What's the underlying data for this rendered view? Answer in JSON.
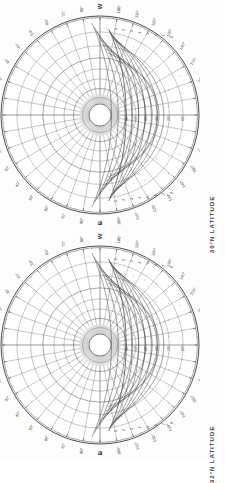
{
  "document": {
    "title": "Celestial Navigation Star Finder Charts",
    "background_color": "#fdfdfd",
    "ink_color": "#3a3a3d",
    "orientation_note": "charts printed rotated 90 degrees"
  },
  "charts": [
    {
      "id": "chart-top",
      "caption": "30°N LATITUDE",
      "latitude_value": 30,
      "latitude_hemisphere": "N",
      "cardinal_points": {
        "left": "N",
        "right": "S",
        "top": "W",
        "bottom": "E"
      },
      "azimuth_labels": [
        "10°",
        "20°",
        "30°",
        "40°",
        "50°",
        "60°",
        "70°",
        "80°",
        "100°",
        "110°",
        "120°",
        "130°",
        "140°",
        "150°",
        "160°",
        "170°"
      ],
      "altitude_labels": [
        "10°",
        "20°",
        "30°",
        "40°",
        "50°",
        "60°",
        "70°",
        "80°"
      ],
      "declination_labels": [
        "0°",
        "10°",
        "20°",
        "30°",
        "40°",
        "50°",
        "60°"
      ],
      "hour_angle_labels": [
        "1",
        "2",
        "3",
        "4",
        "5",
        "6",
        "7",
        "8"
      ],
      "rim_tick_interval_degrees": 5,
      "grid_interval_degrees": 10
    },
    {
      "id": "chart-bottom",
      "caption": "32°N LATITUDE",
      "latitude_value": 32,
      "latitude_hemisphere": "N",
      "cardinal_points": {
        "left": "N",
        "right": "S",
        "top": "W",
        "bottom": "E"
      },
      "azimuth_labels": [
        "10°",
        "20°",
        "30°",
        "40°",
        "50°",
        "60°",
        "70°",
        "80°",
        "100°",
        "110°",
        "120°",
        "130°",
        "140°",
        "150°",
        "160°",
        "170°"
      ],
      "altitude_labels": [
        "10°",
        "20°",
        "30°",
        "40°",
        "50°",
        "60°",
        "70°",
        "80°"
      ],
      "declination_labels": [
        "0°",
        "10°",
        "20°",
        "30°",
        "40°",
        "50°",
        "60°"
      ],
      "hour_angle_labels": [
        "1",
        "2",
        "3",
        "4",
        "5",
        "6",
        "7",
        "8"
      ],
      "rim_tick_interval_degrees": 5,
      "grid_interval_degrees": 10
    }
  ],
  "chart_data": {
    "type": "scatter",
    "subtitle": "Two circular projections, 30°N and 32°N latitude",
    "xlabel": "Azimuth",
    "ylabel": "Altitude",
    "grid": true,
    "legend_position": "none",
    "projection": "stereographic horizon (azimuth-altitude)",
    "panels": [
      {
        "name": "30°N LATITUDE",
        "cardinals": [
          "N",
          "E",
          "S",
          "W"
        ],
        "azimuth_ticks": [
          0,
          10,
          20,
          30,
          40,
          50,
          60,
          70,
          80,
          90,
          100,
          110,
          120,
          130,
          140,
          150,
          160,
          170,
          180
        ],
        "azimuth_tick_labels": [
          "N",
          "10°",
          "20°",
          "30°",
          "40°",
          "50°",
          "60°",
          "70°",
          "80°",
          "W",
          "100°",
          "110°",
          "120°",
          "130°",
          "140°",
          "150°",
          "160°",
          "170°",
          "S"
        ],
        "altitude_circles": [
          0,
          10,
          20,
          30,
          40,
          50,
          60,
          70,
          80,
          90
        ],
        "altitude_circle_labels": [
          "0°",
          "10°",
          "20°",
          "30°",
          "40°",
          "50°",
          "60°",
          "70°",
          "80°",
          "90°"
        ],
        "declination_curves": [
          0,
          10,
          20,
          30,
          40,
          50,
          60
        ],
        "hour_circles": [
          1,
          2,
          3,
          4,
          5,
          6,
          7,
          8
        ],
        "rim_ticks_every": 5,
        "radius_normalized": 1.0
      },
      {
        "name": "32°N LATITUDE",
        "cardinals": [
          "N",
          "E",
          "S",
          "W"
        ],
        "azimuth_ticks": [
          0,
          10,
          20,
          30,
          40,
          50,
          60,
          70,
          80,
          90,
          100,
          110,
          120,
          130,
          140,
          150,
          160,
          170,
          180
        ],
        "azimuth_tick_labels": [
          "N",
          "10°",
          "20°",
          "30°",
          "40°",
          "50°",
          "60°",
          "70°",
          "80°",
          "W",
          "100°",
          "110°",
          "120°",
          "130°",
          "140°",
          "150°",
          "160°",
          "170°",
          "S"
        ],
        "altitude_circles": [
          0,
          10,
          20,
          30,
          40,
          50,
          60,
          70,
          80,
          90
        ],
        "altitude_circle_labels": [
          "0°",
          "10°",
          "20°",
          "30°",
          "40°",
          "50°",
          "60°",
          "70°",
          "80°",
          "90°"
        ],
        "declination_curves": [
          0,
          10,
          20,
          30,
          40,
          50,
          60
        ],
        "hour_circles": [
          1,
          2,
          3,
          4,
          5,
          6,
          7,
          8
        ],
        "rim_ticks_every": 5,
        "radius_normalized": 1.0
      }
    ]
  }
}
